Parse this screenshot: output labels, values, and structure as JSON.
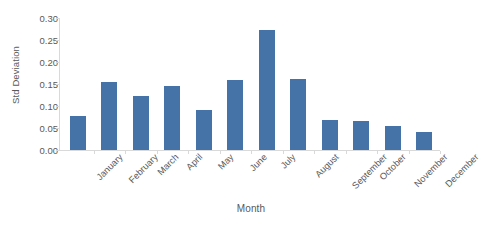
{
  "chart_data": {
    "type": "bar",
    "title": "",
    "xlabel": "Month",
    "ylabel": "Std Deviation",
    "categories": [
      "January",
      "February",
      "March",
      "April",
      "May",
      "June",
      "July",
      "August",
      "September",
      "October",
      "November",
      "December"
    ],
    "values": [
      0.078,
      0.155,
      0.123,
      0.146,
      0.09,
      0.16,
      0.273,
      0.161,
      0.068,
      0.066,
      0.054,
      0.042
    ],
    "series": [
      {
        "name": "Std Deviation",
        "values": [
          0.078,
          0.155,
          0.123,
          0.146,
          0.09,
          0.16,
          0.273,
          0.161,
          0.068,
          0.066,
          0.054,
          0.042
        ]
      }
    ],
    "ylim": [
      0.0,
      0.3
    ],
    "ytick_values": [
      0.0,
      0.05,
      0.1,
      0.15,
      0.2,
      0.25,
      0.3
    ],
    "ytick_labels": [
      "0.00",
      "0.05",
      "0.10",
      "0.15",
      "0.20",
      "0.25",
      "0.30"
    ],
    "grid": false,
    "legend": false,
    "legend_position": "none",
    "bar_color": "#4573a8",
    "axis_color": "#d9d9d9",
    "text_color": "#595959",
    "xtick_label_rotation": -45
  }
}
